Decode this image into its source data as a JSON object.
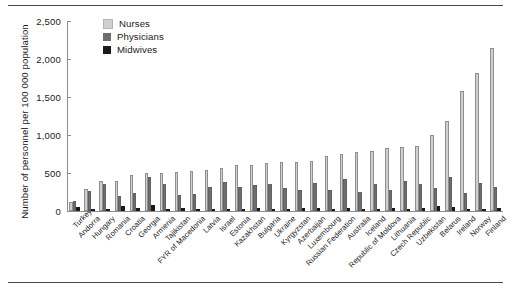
{
  "chart_data": {
    "type": "bar",
    "title": "",
    "subtitle": "",
    "xlabel": "",
    "ylabel": "Number of personnel per 100 000 population",
    "ylim": [
      0,
      2500
    ],
    "yticks": [
      0,
      500,
      1000,
      1500,
      2000,
      2500
    ],
    "ytick_labels": [
      "0",
      "500",
      "1,000",
      "1,500",
      "2,000",
      "2,500"
    ],
    "grid": false,
    "legend_position": "top-left",
    "categories": [
      "Turkey",
      "Andorra",
      "Hungary",
      "Romania",
      "Croatia",
      "Georgia",
      "Armenia",
      "Tajikistan",
      "FYR of Macedonia",
      "Latvia",
      "Israel",
      "Estonia",
      "Kazakhstan",
      "Bulgaria",
      "Ukraine",
      "Kyrgyzstan",
      "Azerbaijan",
      "Luxembourg",
      "Russian Federation",
      "Australia",
      "Iceland",
      "Republic of Moldova",
      "Lithuania",
      "Czech Republic",
      "Uzbekistan",
      "Belarus",
      "Ireland",
      "Norway",
      "Finland"
    ],
    "series": [
      {
        "name": "Nurses",
        "color": "#d0d0d0",
        "values": [
          120,
          290,
          390,
          400,
          480,
          500,
          500,
          510,
          530,
          540,
          570,
          600,
          610,
          630,
          640,
          650,
          660,
          720,
          750,
          770,
          790,
          830,
          840,
          860,
          1000,
          1180,
          1580,
          1820,
          2150
        ]
      },
      {
        "name": "Physicians",
        "color": "#6e6e6e",
        "values": [
          130,
          260,
          350,
          200,
          240,
          450,
          360,
          210,
          220,
          310,
          380,
          320,
          340,
          360,
          300,
          270,
          370,
          270,
          420,
          250,
          360,
          270,
          400,
          350,
          300,
          450,
          240,
          370,
          320
        ]
      },
      {
        "name": "Midwives",
        "color": "#1a1a1a",
        "values": [
          55,
          28,
          30,
          60,
          35,
          85,
          30,
          45,
          25,
          30,
          22,
          30,
          45,
          30,
          28,
          45,
          40,
          15,
          45,
          18,
          18,
          45,
          30,
          35,
          60,
          55,
          20,
          25,
          40
        ]
      }
    ],
    "legend": [
      {
        "label": "Nurses",
        "color": "#d0d0d0"
      },
      {
        "label": "Physicians",
        "color": "#6e6e6e"
      },
      {
        "label": "Midwives",
        "color": "#1a1a1a"
      }
    ]
  }
}
